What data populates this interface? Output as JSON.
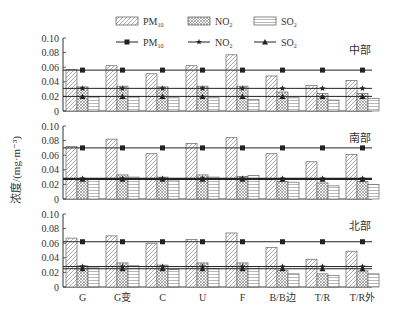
{
  "chart_data": {
    "type": "bar",
    "layout": "three stacked panels sharing x-axis",
    "ylabel": "浓度/(mg·m⁻³)",
    "yticks": [
      "0",
      "0.02",
      "0.04",
      "0.06",
      "0.08",
      "0.10"
    ],
    "ylim": [
      0,
      0.1
    ],
    "categories": [
      "G",
      "G变",
      "C",
      "U",
      "F",
      "B/B边",
      "T/R",
      "T/R外"
    ],
    "legend": {
      "bars": [
        {
          "name": "PM10",
          "base": "PM",
          "sub": "10",
          "pattern": "diagonal-hatch"
        },
        {
          "name": "NO2",
          "base": "NO",
          "sub": "2",
          "pattern": "crosshatch"
        },
        {
          "name": "SO2",
          "base": "SO",
          "sub": "2",
          "pattern": "horizontal-lines"
        }
      ],
      "lines": [
        {
          "name": "PM10",
          "base": "PM",
          "sub": "10",
          "marker": "square"
        },
        {
          "name": "NO2",
          "base": "NO",
          "sub": "2",
          "marker": "star"
        },
        {
          "name": "SO2",
          "base": "SO",
          "sub": "2",
          "marker": "triangle"
        }
      ],
      "position": "top-center"
    },
    "panels": [
      {
        "title": "中部",
        "series": [
          {
            "name": "PM10",
            "values": [
              0.057,
              0.062,
              0.051,
              0.062,
              0.077,
              0.048,
              0.035,
              0.042
            ]
          },
          {
            "name": "NO2",
            "values": [
              0.033,
              0.034,
              0.033,
              0.034,
              0.034,
              0.026,
              0.024,
              0.024
            ]
          },
          {
            "name": "SO2",
            "values": [
              0.02,
              0.02,
              0.018,
              0.018,
              0.016,
              0.018,
              0.015,
              0.017
            ]
          }
        ],
        "reference_lines": {
          "PM10": 0.056,
          "NO2": 0.031,
          "SO2": 0.02
        }
      },
      {
        "title": "南部",
        "series": [
          {
            "name": "PM10",
            "values": [
              0.072,
              0.082,
              0.062,
              0.076,
              0.084,
              0.062,
              0.051,
              0.061
            ]
          },
          {
            "name": "NO2",
            "values": [
              0.027,
              0.033,
              0.03,
              0.033,
              0.031,
              0.024,
              0.022,
              0.024
            ]
          },
          {
            "name": "SO2",
            "values": [
              0.027,
              0.03,
              0.026,
              0.03,
              0.032,
              0.023,
              0.018,
              0.02
            ]
          }
        ],
        "reference_lines": {
          "PM10": 0.07,
          "NO2": 0.028,
          "SO2": 0.027
        }
      },
      {
        "title": "北部",
        "series": [
          {
            "name": "PM10",
            "values": [
              0.067,
              0.07,
              0.06,
              0.065,
              0.074,
              0.054,
              0.038,
              0.049
            ]
          },
          {
            "name": "NO2",
            "values": [
              0.029,
              0.033,
              0.03,
              0.033,
              0.033,
              0.023,
              0.018,
              0.022
            ]
          },
          {
            "name": "SO2",
            "values": [
              0.026,
              0.029,
              0.024,
              0.025,
              0.028,
              0.018,
              0.016,
              0.018
            ]
          }
        ],
        "reference_lines": {
          "PM10": 0.062,
          "NO2": 0.028,
          "SO2": 0.025
        }
      }
    ],
    "grid": false
  }
}
